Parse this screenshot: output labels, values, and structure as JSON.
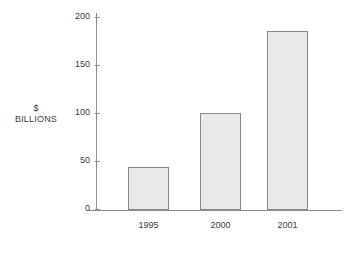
{
  "chart_data": {
    "type": "bar",
    "title": "",
    "subtitle": "",
    "xlabel": "",
    "ylabel": "$ BILLIONS",
    "ylabel_lines": [
      "$",
      "BILLIONS"
    ],
    "categories": [
      "1995",
      "2000",
      "2001"
    ],
    "values": [
      45,
      100,
      186
    ],
    "series": [
      {
        "name": "",
        "values": [
          45,
          100,
          186
        ]
      }
    ],
    "ylim": [
      0,
      200
    ],
    "yticks": [
      0,
      50,
      100,
      150,
      200
    ],
    "ytick_labels": [
      "0",
      "50",
      "100",
      "150",
      "200"
    ],
    "grid": false,
    "legend": null,
    "legend_position": "none",
    "colors": {
      "bar_fill": "#e9e9e9",
      "bar_stroke": "#8a8a8a",
      "axis": "#8d8d8d",
      "text": "#3b3b3b",
      "background": "#ffffff"
    }
  }
}
